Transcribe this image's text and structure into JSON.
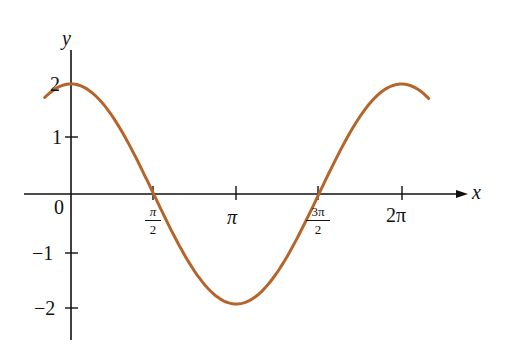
{
  "chart_data": {
    "type": "line",
    "title": "",
    "xlabel": "x",
    "ylabel": "y",
    "function": "y = 2 cos x",
    "x_ticks": [
      "0",
      "π/2",
      "π",
      "3π/2",
      "2π"
    ],
    "y_ticks": [
      "2",
      "1",
      "-1",
      "-2"
    ],
    "xlim": [
      -0.5,
      2.3
    ],
    "ylim": [
      -2.4,
      2.4
    ],
    "x": [
      -0.5,
      0,
      1.5708,
      3.1416,
      4.7124,
      6.2832,
      6.8
    ],
    "y": [
      1.76,
      2,
      0,
      -2,
      0,
      2,
      1.74
    ],
    "series": [
      {
        "name": "2cos x",
        "color": "#b5652a"
      }
    ],
    "grid": false
  },
  "labels": {
    "y_axis": "y",
    "x_axis": "x",
    "origin": "0",
    "y2": "2",
    "y1": "1",
    "ym1": "−1",
    "ym2": "−2",
    "pi": "π",
    "two_pi": "2π",
    "pi_half_num": "π",
    "pi_half_den": "2",
    "three_pi_half_num": "3π",
    "three_pi_half_den": "2"
  }
}
